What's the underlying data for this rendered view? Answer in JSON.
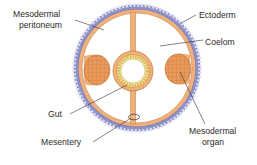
{
  "diagram": {
    "labels": {
      "peritoneum_line1": "Mesodermal",
      "peritoneum_line2": "peritoneum",
      "ectoderm": "Ectoderm",
      "coelom": "Coelom",
      "gut": "Gut",
      "mesentery": "Mesentery",
      "organ_line1": "Mesodermal",
      "organ_line2": "organ"
    },
    "colors": {
      "ectoderm_fill": "#8f93c9",
      "ectoderm_cell_line": "#dcdef2",
      "ectoderm_outline": "#5a5e9a",
      "mesoderm_fill": "#f0b07a",
      "mesoderm_outline": "#c7763a",
      "organ_fill": "#e79a5c",
      "organ_grid": "#c46e33",
      "gut_lining": "#f4e3a0",
      "gut_lining_cells": "#d7b95a",
      "coelom_fill": "#ffffff",
      "leader_line": "#333333",
      "text": "#2b2b2b"
    }
  }
}
